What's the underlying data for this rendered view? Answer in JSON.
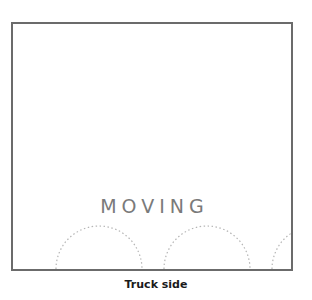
{
  "diagram": {
    "panel_label": "MOVING",
    "caption": "Truck side",
    "colors": {
      "panel_border": "#6b6b6b",
      "label_text": "#7a7a7a",
      "wheel_arc": "#b5b5b5",
      "caption_text": "#1a1a1a"
    },
    "wheel_arcs": [
      {
        "name": "front-wheel-arch",
        "center_x": 86,
        "radius": 43
      },
      {
        "name": "middle-wheel-arch",
        "center_x": 194,
        "radius": 43
      },
      {
        "name": "rear-wheel-arch",
        "center_x": 302,
        "radius": 43
      }
    ]
  }
}
